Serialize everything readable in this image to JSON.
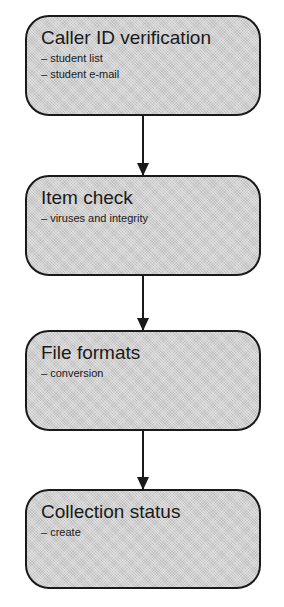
{
  "diagram": {
    "type": "flowchart",
    "direction": "top-to-bottom",
    "nodes": [
      {
        "title": "Caller ID verification",
        "items": [
          "– student list",
          "– student e-mail"
        ]
      },
      {
        "title": "Item check",
        "items": [
          "– viruses and integrity"
        ]
      },
      {
        "title": "File formats",
        "items": [
          "– conversion"
        ]
      },
      {
        "title": "Collection status",
        "items": [
          "– create"
        ]
      }
    ],
    "edges": [
      {
        "from": 0,
        "to": 1
      },
      {
        "from": 1,
        "to": 2
      },
      {
        "from": 2,
        "to": 3
      }
    ]
  }
}
